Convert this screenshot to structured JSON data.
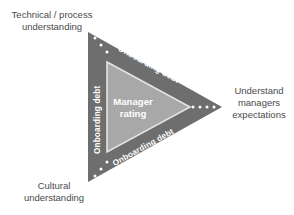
{
  "diagram": {
    "type": "triangle-arrow-diagram",
    "colors": {
      "outer_triangle": "#6e6e6e",
      "inner_triangle": "#a8a8a8",
      "inner_outline": "#e8e8e8",
      "label_text": "#4a4a4a",
      "edge_text": "#ffffff",
      "dot": "#ffffff",
      "background": "#ffffff"
    },
    "corner_labels": {
      "top_left": "Technical / process\nunderstanding",
      "bottom_left": "Cultural\nunderstanding",
      "right": "Understand\nmanagers\nexpectations"
    },
    "edge_labels": {
      "left": "Onboarding debt",
      "top_diagonal": "Onboarding debt",
      "bottom_diagonal": "Onboarding debt"
    },
    "center_label": {
      "line1": "Manager",
      "line2": "rating"
    },
    "dot_groups": {
      "top_left_count": 3,
      "bottom_left_count": 3,
      "right_apex_count": 4
    }
  }
}
